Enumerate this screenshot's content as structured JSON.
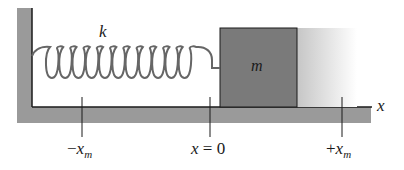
{
  "diagram": {
    "spring": {
      "label": "k",
      "coils": 11
    },
    "block": {
      "label": "m"
    },
    "axis": {
      "label": "x"
    },
    "positions": [
      {
        "name": "neg-amplitude",
        "prefix": "−",
        "symbol": "x",
        "subscript": "m"
      },
      {
        "name": "equilibrium",
        "text": "x = 0"
      },
      {
        "name": "pos-amplitude",
        "prefix": "+",
        "symbol": "x",
        "subscript": "m"
      }
    ],
    "colors": {
      "wall_floor": "#9a9a9a",
      "block": "#7a7a7a",
      "ghost_block_start": "#c8c8c8",
      "ghost_block_end": "#ffffff",
      "spring": "#666666",
      "lines": "#1a1a1a"
    }
  }
}
